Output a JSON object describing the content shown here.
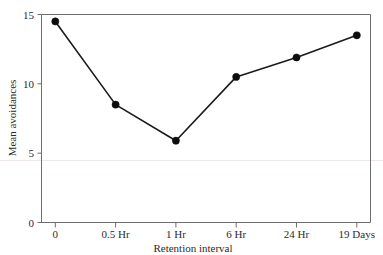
{
  "chart_data": {
    "type": "line",
    "title": "",
    "xlabel": "Retention interval",
    "ylabel": "Mean avoidances",
    "categories": [
      "0",
      "0.5 Hr",
      "1 Hr",
      "6 Hr",
      "24 Hr",
      "19 Days"
    ],
    "values": [
      14.5,
      8.5,
      5.9,
      10.5,
      11.9,
      13.5
    ],
    "ylim": [
      0,
      15
    ],
    "yticks": [
      0,
      5,
      10,
      15
    ],
    "ytick_labels": [
      "0",
      "5",
      "10",
      "15"
    ],
    "grid": false,
    "legend": null,
    "marker": "filled-circle",
    "line_color": "#1a1a1a",
    "marker_color": "#0d0d0d",
    "axis_color": "#6e6e6e"
  },
  "axes": {
    "y_title": "Mean avoidances",
    "x_title": "Retention interval"
  }
}
